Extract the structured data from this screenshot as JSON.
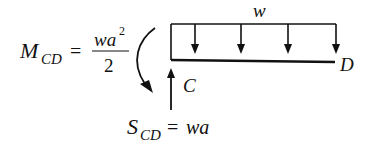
{
  "diagram": {
    "type": "free-body diagram",
    "load_label": "w",
    "point_left": "C",
    "point_right": "D",
    "moment": {
      "symbol": "M",
      "subscript": "CD",
      "equals": "=",
      "numerator": "wa",
      "numerator_exp": "2",
      "denominator": "2"
    },
    "shear": {
      "symbol": "S",
      "subscript": "CD",
      "equals": "=",
      "value": "wa"
    },
    "load_arrow_count": 4,
    "colors": {
      "ink": "#111111",
      "background": "#ffffff"
    }
  }
}
